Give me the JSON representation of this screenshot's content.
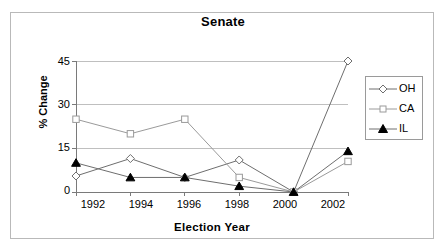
{
  "chart_data": {
    "type": "line",
    "title": "Senate",
    "xlabel": "Election Year",
    "ylabel": "% Change",
    "categories": [
      "1992",
      "1994",
      "1996",
      "1998",
      "2000",
      "2002"
    ],
    "x": [
      1992,
      1994,
      1996,
      1998,
      2000,
      2002
    ],
    "series": [
      {
        "name": "OH",
        "marker": "diamond-open",
        "values": [
          5.5,
          11.5,
          5,
          11,
          0,
          45
        ]
      },
      {
        "name": "CA",
        "marker": "square-open",
        "values": [
          25,
          20,
          25,
          5,
          0,
          10.5
        ]
      },
      {
        "name": "IL",
        "marker": "triangle-filled",
        "values": [
          10,
          5,
          5,
          2,
          0,
          14
        ]
      }
    ],
    "ylim": [
      0,
      45
    ],
    "yticks": [
      0,
      15,
      30,
      45
    ],
    "ytick_labels": [
      "0",
      "15",
      "30",
      "45"
    ],
    "grid": "horizontal",
    "legend_position": "right",
    "colors": {
      "line": "#6e6e6e",
      "axis": "#7a7a7a",
      "grid": "#bfbfbf",
      "text": "#000000",
      "frame": "#b9b9b9",
      "marker_fill_open": "#ffffff",
      "marker_fill_solid": "#000000"
    }
  },
  "legend": {
    "entries": [
      {
        "label": "OH"
      },
      {
        "label": "CA"
      },
      {
        "label": "IL"
      }
    ]
  }
}
